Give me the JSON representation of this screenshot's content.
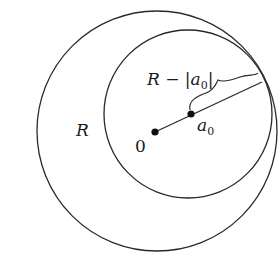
{
  "diagram": {
    "type": "geometry",
    "stroke_color": "#2a2a2a",
    "outer_circle": {
      "label": "R",
      "center": [
        157,
        131
      ],
      "radius": 120
    },
    "inner_circle": {
      "center": [
        188,
        114
      ],
      "radius": 84
    },
    "points": [
      {
        "id": "origin",
        "label": "0",
        "position": [
          155,
          132
        ]
      },
      {
        "id": "a0",
        "label_main": "a",
        "label_sub": "0",
        "position": [
          191,
          114
        ]
      }
    ],
    "radius_segment": {
      "from": "origin",
      "to_circle_point": [
        262,
        82
      ]
    },
    "brace": {
      "label_prefix": "R − |",
      "label_main": "a",
      "label_sub": "0",
      "label_suffix": "|"
    }
  }
}
